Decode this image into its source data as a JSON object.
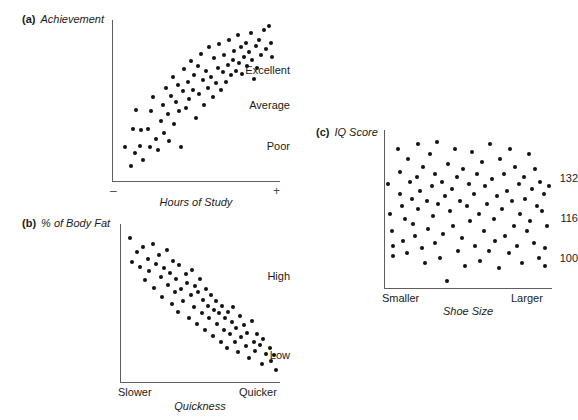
{
  "figure": {
    "kind": "three-panel-scatterplot-figure",
    "background": "#ffffff",
    "dot_color": "#111111",
    "axis_color": "#5f5f5f"
  },
  "panels": {
    "a": {
      "tag": "(a)",
      "title": "Achievement",
      "xlabel": "Hours of Study",
      "ytick_labels": [
        "Excellent",
        "Average",
        "Poor"
      ],
      "x_end_left": "–",
      "x_end_right": "+"
    },
    "b": {
      "tag": "(b)",
      "title": "% of Body Fat",
      "xlabel": "Quickness",
      "ytick_labels": [
        "High",
        "Low"
      ],
      "x_end_left": "Slower",
      "x_end_right": "Quicker"
    },
    "c": {
      "tag": "(c)",
      "title": "IQ Score",
      "xlabel": "Shoe Size",
      "ytick_labels": [
        "132",
        "116",
        "100"
      ],
      "x_end_left": "Smaller",
      "x_end_right": "Larger"
    }
  },
  "chart_data": [
    {
      "id": "a",
      "type": "scatter",
      "title": "Achievement",
      "xlabel": "Hours of Study",
      "ylabel": "Achievement",
      "relationship": "positive correlation",
      "grid": false,
      "legend": null,
      "xlim": [
        0,
        100
      ],
      "ylim": [
        0,
        100
      ],
      "xtick_labels": [
        "–",
        "+"
      ],
      "xtick_values": [
        0,
        100
      ],
      "ytick_labels": [
        "Poor",
        "Average",
        "Excellent"
      ],
      "ytick_values": [
        22,
        52,
        78
      ],
      "points": [
        [
          7,
          21
        ],
        [
          11,
          9
        ],
        [
          12,
          33
        ],
        [
          13,
          17
        ],
        [
          14,
          45
        ],
        [
          16,
          22
        ],
        [
          17,
          32
        ],
        [
          18,
          13
        ],
        [
          21,
          33
        ],
        [
          22,
          21
        ],
        [
          23,
          44
        ],
        [
          24,
          53
        ],
        [
          26,
          26
        ],
        [
          27,
          19
        ],
        [
          29,
          38
        ],
        [
          30,
          48
        ],
        [
          31,
          30
        ],
        [
          32,
          59
        ],
        [
          33,
          42
        ],
        [
          34,
          25
        ],
        [
          35,
          54
        ],
        [
          36,
          66
        ],
        [
          37,
          36
        ],
        [
          38,
          50
        ],
        [
          39,
          61
        ],
        [
          40,
          44
        ],
        [
          41,
          21
        ],
        [
          42,
          57
        ],
        [
          43,
          71
        ],
        [
          44,
          46
        ],
        [
          45,
          63
        ],
        [
          46,
          52
        ],
        [
          47,
          76
        ],
        [
          48,
          58
        ],
        [
          49,
          67
        ],
        [
          50,
          40
        ],
        [
          51,
          73
        ],
        [
          52,
          55
        ],
        [
          53,
          81
        ],
        [
          54,
          64
        ],
        [
          55,
          48
        ],
        [
          56,
          70
        ],
        [
          57,
          59
        ],
        [
          58,
          85
        ],
        [
          59,
          66
        ],
        [
          60,
          53
        ],
        [
          61,
          78
        ],
        [
          62,
          62
        ],
        [
          63,
          72
        ],
        [
          64,
          87
        ],
        [
          65,
          58
        ],
        [
          66,
          69
        ],
        [
          67,
          80
        ],
        [
          68,
          63
        ],
        [
          69,
          74
        ],
        [
          70,
          90
        ],
        [
          71,
          67
        ],
        [
          72,
          77
        ],
        [
          73,
          83
        ],
        [
          74,
          70
        ],
        [
          75,
          93
        ],
        [
          76,
          75
        ],
        [
          77,
          85
        ],
        [
          78,
          68
        ],
        [
          79,
          79
        ],
        [
          80,
          88
        ],
        [
          81,
          73
        ],
        [
          82,
          82
        ],
        [
          83,
          94
        ],
        [
          84,
          77
        ],
        [
          85,
          65
        ],
        [
          86,
          86
        ],
        [
          87,
          72
        ],
        [
          88,
          90
        ],
        [
          89,
          80
        ],
        [
          91,
          96
        ],
        [
          92,
          84
        ],
        [
          94,
          99
        ],
        [
          95,
          88
        ],
        [
          96,
          79
        ]
      ]
    },
    {
      "id": "b",
      "type": "scatter",
      "title": "% of Body Fat",
      "xlabel": "Quickness",
      "ylabel": "% of Body Fat",
      "relationship": "negative correlation",
      "grid": false,
      "legend": null,
      "xlim": [
        0,
        100
      ],
      "ylim": [
        0,
        100
      ],
      "xtick_labels": [
        "Slower",
        "Quicker"
      ],
      "xtick_values": [
        0,
        100
      ],
      "ytick_labels": [
        "Low",
        "High"
      ],
      "ytick_values": [
        18,
        78
      ],
      "points": [
        [
          6,
          94
        ],
        [
          7,
          78
        ],
        [
          10,
          85
        ],
        [
          12,
          75
        ],
        [
          14,
          88
        ],
        [
          15,
          66
        ],
        [
          17,
          80
        ],
        [
          18,
          72
        ],
        [
          20,
          90
        ],
        [
          21,
          61
        ],
        [
          22,
          77
        ],
        [
          24,
          83
        ],
        [
          25,
          68
        ],
        [
          26,
          55
        ],
        [
          27,
          74
        ],
        [
          29,
          86
        ],
        [
          30,
          63
        ],
        [
          31,
          71
        ],
        [
          32,
          50
        ],
        [
          33,
          79
        ],
        [
          34,
          58
        ],
        [
          35,
          67
        ],
        [
          36,
          45
        ],
        [
          37,
          76
        ],
        [
          38,
          60
        ],
        [
          39,
          52
        ],
        [
          41,
          70
        ],
        [
          42,
          64
        ],
        [
          43,
          41
        ],
        [
          44,
          56
        ],
        [
          45,
          73
        ],
        [
          46,
          48
        ],
        [
          47,
          62
        ],
        [
          48,
          37
        ],
        [
          49,
          58
        ],
        [
          50,
          67
        ],
        [
          51,
          44
        ],
        [
          52,
          53
        ],
        [
          53,
          33
        ],
        [
          54,
          60
        ],
        [
          55,
          49
        ],
        [
          56,
          41
        ],
        [
          57,
          56
        ],
        [
          58,
          29
        ],
        [
          59,
          46
        ],
        [
          60,
          52
        ],
        [
          61,
          37
        ],
        [
          62,
          44
        ],
        [
          63,
          25
        ],
        [
          64,
          49
        ],
        [
          65,
          33
        ],
        [
          66,
          41
        ],
        [
          67,
          21
        ],
        [
          68,
          45
        ],
        [
          69,
          30
        ],
        [
          70,
          38
        ],
        [
          71,
          48
        ],
        [
          72,
          25
        ],
        [
          73,
          34
        ],
        [
          74,
          18
        ],
        [
          75,
          42
        ],
        [
          76,
          28
        ],
        [
          78,
          36
        ],
        [
          79,
          22
        ],
        [
          80,
          31
        ],
        [
          81,
          14
        ],
        [
          83,
          39
        ],
        [
          84,
          25
        ],
        [
          85,
          19
        ],
        [
          86,
          30
        ],
        [
          88,
          23
        ],
        [
          89,
          10
        ],
        [
          90,
          27
        ],
        [
          92,
          17
        ],
        [
          94,
          21
        ],
        [
          95,
          12
        ],
        [
          97,
          16
        ],
        [
          98,
          6
        ]
      ]
    },
    {
      "id": "c",
      "type": "scatter",
      "title": "IQ Score",
      "xlabel": "Shoe Size",
      "ylabel": "IQ Score",
      "relationship": "no correlation (zero relationship)",
      "grid": false,
      "legend": null,
      "xlim": [
        0,
        100
      ],
      "ylim": [
        85,
        148
      ],
      "xtick_labels": [
        "Smaller",
        "Larger"
      ],
      "xtick_values": [
        0,
        100
      ],
      "ytick_labels": [
        "100",
        "116",
        "132"
      ],
      "ytick_values": [
        100,
        116,
        132
      ],
      "points": [
        [
          2,
          127
        ],
        [
          3,
          115
        ],
        [
          4,
          108
        ],
        [
          5,
          102
        ],
        [
          5,
          98
        ],
        [
          8,
          141
        ],
        [
          9,
          132
        ],
        [
          9,
          123
        ],
        [
          10,
          118
        ],
        [
          11,
          104
        ],
        [
          12,
          113
        ],
        [
          13,
          99
        ],
        [
          14,
          137
        ],
        [
          15,
          128
        ],
        [
          16,
          121
        ],
        [
          17,
          111
        ],
        [
          18,
          106
        ],
        [
          19,
          130
        ],
        [
          20,
          143
        ],
        [
          20,
          117
        ],
        [
          21,
          124
        ],
        [
          22,
          101
        ],
        [
          23,
          134
        ],
        [
          24,
          95
        ],
        [
          25,
          120
        ],
        [
          26,
          109
        ],
        [
          27,
          139
        ],
        [
          28,
          126
        ],
        [
          29,
          114
        ],
        [
          30,
          103
        ],
        [
          30,
          131
        ],
        [
          31,
          144
        ],
        [
          32,
          119
        ],
        [
          33,
          97
        ],
        [
          34,
          128
        ],
        [
          35,
          107
        ],
        [
          36,
          122
        ],
        [
          37,
          88
        ],
        [
          38,
          135
        ],
        [
          39,
          116
        ],
        [
          40,
          125
        ],
        [
          41,
          110
        ],
        [
          42,
          141
        ],
        [
          43,
          130
        ],
        [
          44,
          100
        ],
        [
          45,
          120
        ],
        [
          46,
          105
        ],
        [
          47,
          133
        ],
        [
          48,
          94
        ],
        [
          49,
          118
        ],
        [
          50,
          127
        ],
        [
          51,
          112
        ],
        [
          52,
          140
        ],
        [
          53,
          123
        ],
        [
          54,
          102
        ],
        [
          55,
          131
        ],
        [
          56,
          115
        ],
        [
          57,
          96
        ],
        [
          58,
          136
        ],
        [
          59,
          108
        ],
        [
          60,
          126
        ],
        [
          61,
          119
        ],
        [
          62,
          100
        ],
        [
          63,
          143
        ],
        [
          64,
          129
        ],
        [
          65,
          113
        ],
        [
          66,
          104
        ],
        [
          67,
          122
        ],
        [
          68,
          93
        ],
        [
          69,
          137
        ],
        [
          70,
          117
        ],
        [
          71,
          131
        ],
        [
          72,
          106
        ],
        [
          73,
          124
        ],
        [
          74,
          99
        ],
        [
          75,
          141
        ],
        [
          76,
          120
        ],
        [
          77,
          110
        ],
        [
          78,
          134
        ],
        [
          79,
          102
        ],
        [
          80,
          127
        ],
        [
          81,
          115
        ],
        [
          82,
          95
        ],
        [
          83,
          130
        ],
        [
          84,
          121
        ],
        [
          85,
          108
        ],
        [
          86,
          139
        ],
        [
          87,
          112
        ],
        [
          88,
          125
        ],
        [
          89,
          103
        ],
        [
          90,
          133
        ],
        [
          91,
          118
        ],
        [
          92,
          97
        ],
        [
          93,
          128
        ],
        [
          94,
          116
        ],
        [
          95,
          123
        ],
        [
          96,
          101
        ],
        [
          96,
          94
        ],
        [
          97,
          110
        ],
        [
          98,
          126
        ]
      ]
    }
  ]
}
